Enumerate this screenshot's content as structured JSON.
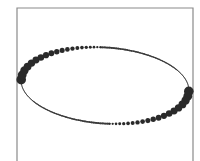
{
  "diagram": {
    "colors": {
      "background": "#ffffff",
      "frame": "#8a8a8a",
      "dots": "#2a2a2a",
      "line": "#3a3a3a"
    },
    "frame": {
      "left": 17,
      "top": 8,
      "right": 193,
      "bottom": 170,
      "stroke_width": 1.2
    },
    "ellipse": {
      "cx": 105,
      "cy": 85.5,
      "rx": 84,
      "ry": 38,
      "rotation_deg": 4
    },
    "upper_dots": {
      "start_angle_deg": 180,
      "end_angle_deg": 265,
      "count": 20,
      "r_start": 4.8,
      "r_end": 1.0
    },
    "upper_taper_line": {
      "start_angle_deg": 265,
      "end_angle_deg": 358,
      "width_start": 1.8,
      "width_end": 0.6
    },
    "lower_dots": {
      "start_angle_deg": 0,
      "end_angle_deg": 85,
      "count": 20,
      "r_start": 4.8,
      "r_end": 1.0
    },
    "lower_taper_line": {
      "start_angle_deg": 85,
      "end_angle_deg": 178,
      "width_start": 1.8,
      "width_end": 0.6
    }
  }
}
